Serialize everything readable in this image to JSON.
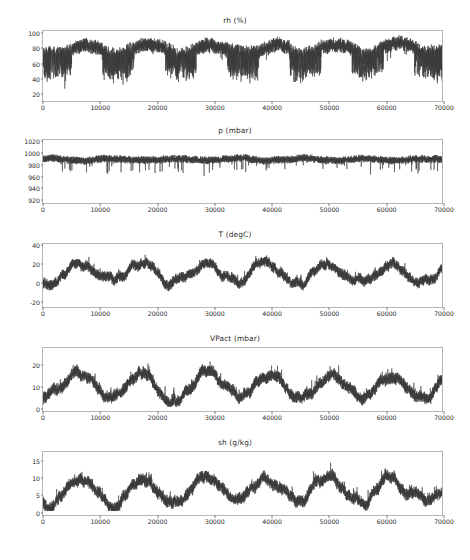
{
  "figure": {
    "background_color": "#ffffff",
    "trace_color": "#3b3b3b",
    "axis_color": "#b6b6b6",
    "text_color": "#2b2b2b"
  },
  "chart_data": [
    {
      "type": "line",
      "title": "rh (%)",
      "xlabel": "",
      "ylabel": "",
      "xlim": [
        0,
        70000
      ],
      "ylim": [
        8,
        103
      ],
      "grid": false,
      "legend": null,
      "xticks": [
        "0",
        "10000",
        "20000",
        "30000",
        "40000",
        "50000",
        "60000",
        "70000"
      ],
      "xtick_values": [
        0,
        10000,
        20000,
        30000,
        40000,
        50000,
        60000,
        70000
      ],
      "yticks": [
        "100",
        "80",
        "60",
        "40",
        "20"
      ],
      "ytick_values": [
        100,
        80,
        60,
        40,
        20
      ],
      "series": [
        {
          "name": "rh",
          "seed": 11,
          "baseline": 78,
          "season_amp": 6,
          "season_periods": 6.4,
          "season_phase": 3.4,
          "noise_amp": 19,
          "spike_amp": 9,
          "clip_max": 100,
          "clip_min": 14
        }
      ]
    },
    {
      "type": "line",
      "title": "p (mbar)",
      "xlabel": "",
      "ylabel": "",
      "xlim": [
        0,
        70000
      ],
      "ylim": [
        912,
        1022
      ],
      "grid": false,
      "legend": null,
      "xticks": [
        "0",
        "10000",
        "20000",
        "30000",
        "40000",
        "50000",
        "60000",
        "70000"
      ],
      "xtick_values": [
        0,
        10000,
        20000,
        30000,
        40000,
        50000,
        60000,
        70000
      ],
      "yticks": [
        "1020",
        "1000",
        "980",
        "960",
        "940",
        "920"
      ],
      "ytick_values": [
        1020,
        1000,
        980,
        960,
        940,
        920
      ],
      "series": [
        {
          "name": "p",
          "seed": 23,
          "baseline": 988,
          "season_amp": 2,
          "season_periods": 6.4,
          "season_phase": 0.8,
          "noise_amp": 13,
          "spike_amp": 16,
          "clip_max": 1014,
          "clip_min": 938
        }
      ]
    },
    {
      "type": "line",
      "title": "T (degC)",
      "xlabel": "",
      "ylabel": "",
      "xlim": [
        0,
        70000
      ],
      "ylim": [
        -27,
        41
      ],
      "grid": false,
      "legend": null,
      "xticks": [
        "0",
        "10000",
        "20000",
        "30000",
        "40000",
        "50000",
        "60000",
        "70000"
      ],
      "xtick_values": [
        0,
        10000,
        20000,
        30000,
        40000,
        50000,
        60000,
        70000
      ],
      "yticks": [
        "40",
        "20",
        "0",
        "-20"
      ],
      "ytick_values": [
        40,
        20,
        0,
        -20
      ],
      "series": [
        {
          "name": "T",
          "seed": 37,
          "baseline": 9.5,
          "season_amp": 9.5,
          "season_periods": 6.4,
          "season_phase": 4.1,
          "noise_amp": 11,
          "spike_amp": 5,
          "clip_max": 36,
          "clip_min": -23
        }
      ]
    },
    {
      "type": "line",
      "title": "VPact (mbar)",
      "xlabel": "",
      "ylabel": "",
      "xlim": [
        0,
        70000
      ],
      "ylim": [
        -2,
        28
      ],
      "grid": false,
      "legend": null,
      "xticks": [
        "0",
        "10000",
        "20000",
        "30000",
        "40000",
        "50000",
        "60000",
        "70000"
      ],
      "xtick_values": [
        0,
        10000,
        20000,
        30000,
        40000,
        50000,
        60000,
        70000
      ],
      "yticks": [
        "20",
        "10",
        "0"
      ],
      "ytick_values": [
        20,
        10,
        0
      ],
      "series": [
        {
          "name": "VPact",
          "seed": 53,
          "baseline": 9.6,
          "season_amp": 5.0,
          "season_periods": 6.4,
          "season_phase": 4.1,
          "noise_amp": 5.6,
          "spike_amp": 3.0,
          "clip_max": 26,
          "clip_min": 0
        }
      ]
    },
    {
      "type": "line",
      "title": "sh (g/kg)",
      "xlabel": "",
      "ylabel": "",
      "xlim": [
        0,
        70000
      ],
      "ylim": [
        -1.2,
        17.5
      ],
      "grid": false,
      "legend": null,
      "xticks": [
        "0",
        "10000",
        "20000",
        "30000",
        "40000",
        "50000",
        "60000",
        "70000"
      ],
      "xtick_values": [
        0,
        10000,
        20000,
        30000,
        40000,
        50000,
        60000,
        70000
      ],
      "yticks": [
        "15",
        "10",
        "5",
        "0"
      ],
      "ytick_values": [
        15,
        10,
        5,
        0
      ],
      "series": [
        {
          "name": "sh",
          "seed": 71,
          "baseline": 6.0,
          "season_amp": 3.1,
          "season_periods": 6.4,
          "season_phase": 4.1,
          "noise_amp": 3.5,
          "spike_amp": 1.9,
          "clip_max": 16.2,
          "clip_min": 0
        }
      ]
    }
  ],
  "layout": {
    "subplots": [
      {
        "title_top": 16,
        "axes_top": 30,
        "axes_height": 72
      },
      {
        "title_top": 126,
        "axes_top": 139,
        "axes_height": 65
      },
      {
        "title_top": 230,
        "axes_top": 243,
        "axes_height": 65
      },
      {
        "title_top": 334,
        "axes_top": 347,
        "axes_height": 65
      },
      {
        "title_top": 438,
        "axes_top": 451,
        "axes_height": 65
      }
    ]
  }
}
